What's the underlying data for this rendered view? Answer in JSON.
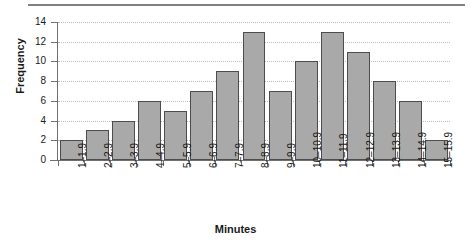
{
  "chart_data": {
    "type": "bar",
    "title": "",
    "xlabel": "Minutes",
    "ylabel": "Frequency",
    "categories": [
      "1–1.9",
      "2–2.9",
      "3–3.9",
      "4–4.9",
      "5–5.9",
      "6–6.9",
      "7–7.9",
      "8–8.9",
      "9–9.9",
      "10–10.9",
      "11–11.9",
      "12–12.9",
      "13–13.9",
      "14–14.9",
      "15–15.9"
    ],
    "values": [
      2,
      3,
      4,
      6,
      5,
      7,
      9,
      13,
      7,
      10,
      13,
      11,
      8,
      6,
      2
    ],
    "ylim": [
      0,
      14
    ],
    "yticks": [
      0,
      2,
      4,
      6,
      8,
      10,
      12,
      14
    ],
    "ytick_labels": [
      "0",
      "2",
      "4",
      "6",
      "8",
      "10",
      "12",
      "14"
    ],
    "grid": true,
    "grid_axis": "y",
    "legend": "none",
    "bar_fill_color": "#a9a9a9",
    "bar_edge_color": "#4d4d4d",
    "gridline_color": "#bdbdbd",
    "axis_color": "#707070",
    "text_color": "#1a1a1a"
  }
}
